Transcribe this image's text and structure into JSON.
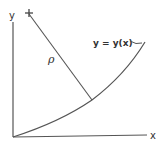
{
  "diagram": {
    "axes": {
      "x_label": "x",
      "y_label": "y"
    },
    "curve_label": "y = y(x)",
    "radius_label": "ρ",
    "center_marker": "+",
    "colors": {
      "stroke": "#555555",
      "text": "#333333",
      "background": "#ffffff"
    }
  }
}
